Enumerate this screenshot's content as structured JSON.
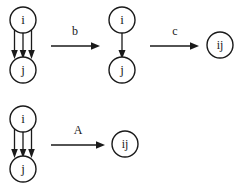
{
  "figure": {
    "type": "graph-rewriting-diagram",
    "background_color": "#ffffff",
    "ink_color": "#1a1a1a"
  },
  "rows": [
    {
      "id": "row-top",
      "stages": [
        {
          "id": "stage-multi-edge",
          "kind": "graph",
          "nodes": [
            {
              "id": "node-i",
              "label": "i",
              "cx": 23,
              "cy": 20,
              "r": 13
            },
            {
              "id": "node-j",
              "label": "j",
              "cx": 23,
              "cy": 70,
              "r": 13
            }
          ],
          "edge_count": 3,
          "edge_direction": "i-to-j"
        },
        {
          "id": "stage-single-edge",
          "kind": "graph",
          "nodes": [
            {
              "id": "node-i",
              "label": "i",
              "cx": 122,
              "cy": 20,
              "r": 13
            },
            {
              "id": "node-j",
              "label": "j",
              "cx": 122,
              "cy": 70,
              "r": 13
            }
          ],
          "edge_count": 1,
          "edge_direction": "i-to-j"
        },
        {
          "id": "stage-merged",
          "kind": "graph",
          "nodes": [
            {
              "id": "node-ij",
              "label": "ij",
              "cx": 220,
              "cy": 45,
              "r": 13
            }
          ],
          "edge_count": 0,
          "edge_direction": "none"
        }
      ],
      "transforms": [
        {
          "id": "transform-b",
          "label": "b",
          "x1": 51,
          "x2": 99,
          "y": 46,
          "label_x": 75,
          "label_y": 32
        },
        {
          "id": "transform-c",
          "label": "c",
          "x1": 150,
          "x2": 199,
          "y": 46,
          "label_x": 175,
          "label_y": 32
        }
      ]
    },
    {
      "id": "row-bottom",
      "stages": [
        {
          "id": "stage-multi-edge-2",
          "kind": "graph",
          "nodes": [
            {
              "id": "node-i",
              "label": "i",
              "cx": 23,
              "cy": 119,
              "r": 13
            },
            {
              "id": "node-j",
              "label": "j",
              "cx": 23,
              "cy": 169,
              "r": 13
            }
          ],
          "edge_count": 3,
          "edge_direction": "i-to-j"
        },
        {
          "id": "stage-merged-2",
          "kind": "graph",
          "nodes": [
            {
              "id": "node-ij",
              "label": "ij",
              "cx": 125,
              "cy": 144,
              "r": 13
            }
          ],
          "edge_count": 0,
          "edge_direction": "none"
        }
      ],
      "transforms": [
        {
          "id": "transform-A",
          "label": "A",
          "x1": 51,
          "x2": 105,
          "y": 145,
          "label_x": 78,
          "label_y": 131
        }
      ]
    }
  ],
  "labels": {
    "node_i": "i",
    "node_j": "j",
    "node_ij": "ij",
    "transform_b": "b",
    "transform_c": "c",
    "transform_A": "A"
  }
}
